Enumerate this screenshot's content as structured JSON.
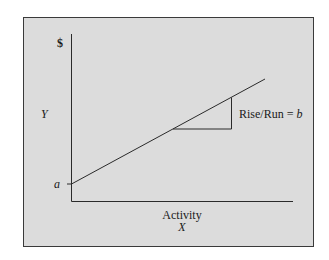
{
  "diagram": {
    "type": "cost-behavior-graph",
    "colors": {
      "panel_fill": "#dcdcdc",
      "panel_border": "#3a3a3a",
      "line": "#2a2a2a",
      "text": "#1a1a1a"
    },
    "y_axis": {
      "unit_label": "$",
      "variable_label": "Y"
    },
    "x_axis": {
      "title": "Activity",
      "variable_label": "X"
    },
    "intercept_label": "a",
    "slope_annotation": {
      "text_prefix": "Rise/Run = ",
      "variable": "b"
    }
  }
}
